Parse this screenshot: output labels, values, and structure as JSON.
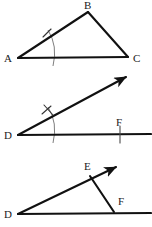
{
  "figure": {
    "background_color": "#ffffff",
    "stroke_color": "#111111",
    "arc_color": "#6e6e6e",
    "tick_color": "#4a4a4a",
    "width": 152,
    "height": 227
  },
  "panels": [
    {
      "id": "panel-1",
      "name": "original-angle-triangle",
      "description": "Triangle ABC with compass arc through angle A",
      "vertices": [
        {
          "label": "A",
          "x": 18,
          "y": 58,
          "label_x": 4,
          "label_y": 62
        },
        {
          "label": "B",
          "x": 88,
          "y": 12,
          "label_x": 84,
          "label_y": 9
        },
        {
          "label": "C",
          "x": 128,
          "y": 57,
          "label_x": 133,
          "label_y": 62
        }
      ],
      "segments": [
        {
          "name": "segment-AB",
          "x1": 18,
          "y1": 58,
          "x2": 88,
          "y2": 12
        },
        {
          "name": "segment-BC",
          "x1": 88,
          "y1": 12,
          "x2": 128,
          "y2": 57
        },
        {
          "name": "segment-AC",
          "x1": 18,
          "y1": 58,
          "x2": 128,
          "y2": 57
        }
      ],
      "arcs": [
        {
          "name": "compass-arc-A",
          "d": "M 48 30 Q 58 46 53 66"
        }
      ],
      "ticks": [
        {
          "name": "tick-on-AB",
          "x1": 43,
          "y1": 37,
          "x2": 51,
          "y2": 29
        }
      ]
    },
    {
      "id": "panel-2",
      "name": "copied-angle-ray",
      "description": "Ray from D with arrowhead, arc and double tick, baseline with point F",
      "vertices": [
        {
          "label": "D",
          "x": 18,
          "y": 135,
          "label_x": 4,
          "label_y": 139
        },
        {
          "label": "F",
          "x": 120,
          "y": 134,
          "label_x": 116,
          "label_y": 126
        }
      ],
      "segments": [
        {
          "name": "baseline-DF",
          "x1": 18,
          "y1": 135,
          "x2": 150,
          "y2": 134
        }
      ],
      "rays": [
        {
          "name": "ray-D-arrow",
          "x1": 18,
          "y1": 135,
          "x2": 128,
          "y2": 76
        }
      ],
      "arcs": [
        {
          "name": "compass-arc-D",
          "d": "M 48 107 Q 58 123 53 143"
        }
      ],
      "ticks": [
        {
          "name": "tick-a-on-ray",
          "x1": 42,
          "y1": 114,
          "x2": 51,
          "y2": 106
        },
        {
          "name": "tick-b-on-ray",
          "x1": 44,
          "y1": 105,
          "x2": 53,
          "y2": 115
        },
        {
          "name": "tick-at-F",
          "x1": 120,
          "y1": 126,
          "x2": 120,
          "y2": 143
        }
      ]
    },
    {
      "id": "panel-3",
      "name": "completed-triangle-DEF",
      "description": "Triangle DEF formed by ray DE with arrowhead, chord EF and baseline DF",
      "vertices": [
        {
          "label": "D",
          "x": 18,
          "y": 214,
          "label_x": 4,
          "label_y": 218
        },
        {
          "label": "E",
          "x": 90,
          "y": 176,
          "label_x": 84,
          "label_y": 170
        },
        {
          "label": "F",
          "x": 114,
          "y": 212,
          "label_x": 118,
          "label_y": 205
        }
      ],
      "segments": [
        {
          "name": "baseline-DF",
          "x1": 18,
          "y1": 214,
          "x2": 150,
          "y2": 213
        },
        {
          "name": "segment-EF",
          "x1": 90,
          "y1": 176,
          "x2": 114,
          "y2": 212
        }
      ],
      "rays": [
        {
          "name": "ray-D-E-arrow",
          "x1": 18,
          "y1": 214,
          "x2": 118,
          "y2": 166
        }
      ],
      "arcs": [],
      "ticks": []
    }
  ]
}
